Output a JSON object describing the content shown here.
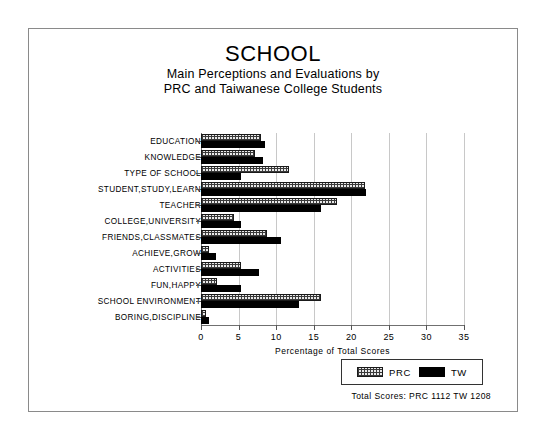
{
  "header": {
    "title": "SCHOOL",
    "subtitle_line1": "Main Perceptions and Evaluations by",
    "subtitle_line2": "PRC and Taiwanese College Students"
  },
  "legend": {
    "prc_label": "PRC",
    "tw_label": "TW",
    "prc_swatch": "hatched-swatch-icon",
    "tw_swatch": "solid-black-swatch-icon"
  },
  "footer": {
    "totals": "Total Scores:  PRC 1112   TW 1208"
  },
  "chart_data": {
    "type": "bar",
    "orientation": "horizontal",
    "title": "SCHOOL",
    "subtitle": "Main Perceptions and Evaluations by PRC and Taiwanese College Students",
    "xlabel": "Percentage of Total Scores",
    "ylabel": "",
    "xlim": [
      0,
      35
    ],
    "xticks": [
      0,
      5,
      10,
      15,
      20,
      25,
      30,
      35
    ],
    "xtick_labels": [
      "0",
      "5",
      "10",
      "15",
      "20",
      "25",
      "30",
      "35"
    ],
    "grid": true,
    "grid_axis": "x",
    "legend_position": "bottom-right",
    "categories": [
      "EDUCATION",
      "KNOWLEDGE",
      "TYPE OF SCHOOL",
      "STUDENT,STUDY,LEARN",
      "TEACHER",
      "COLLEGE,UNIVERSITY",
      "FRIENDS,CLASSMATES",
      "ACHIEVE,GROW",
      "ACTIVITIES",
      "FUN,HAPPY",
      "SCHOOL ENVIRONMENT",
      "BORING,DISCIPLINE"
    ],
    "series": [
      {
        "name": "PRC",
        "color": "#e9e9e9",
        "pattern": "crosshatch",
        "total_scores": 1112,
        "values": [
          8.0,
          7.2,
          11.7,
          21.8,
          18.1,
          4.4,
          8.8,
          1.1,
          5.3,
          2.1,
          16.0,
          0.7
        ]
      },
      {
        "name": "TW",
        "color": "#000000",
        "pattern": "solid",
        "total_scores": 1208,
        "values": [
          8.5,
          8.3,
          5.3,
          22.0,
          16.0,
          5.3,
          10.7,
          2.0,
          7.7,
          5.3,
          13.1,
          1.1
        ]
      }
    ]
  }
}
